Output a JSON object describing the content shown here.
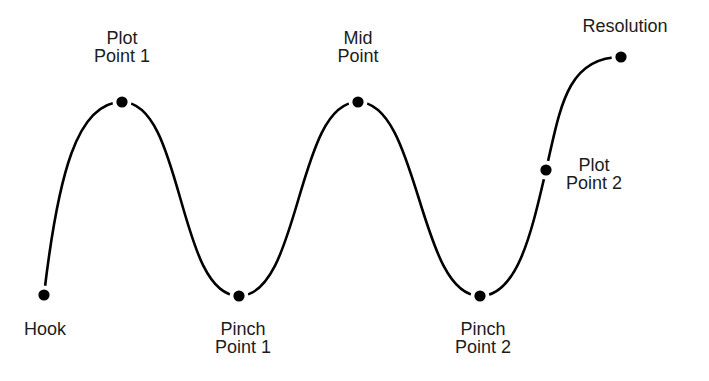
{
  "diagram": {
    "title": "",
    "type": "story-structure-curve",
    "colors": {
      "line": "#000000",
      "dot": "#000000",
      "text": "#1c1c1c",
      "background": "#ffffff"
    },
    "points": [
      {
        "id": "hook",
        "label_lines": [
          "Hook"
        ],
        "level": "low",
        "label_position": "below"
      },
      {
        "id": "plot-point-1",
        "label_lines": [
          "Plot",
          "Point 1"
        ],
        "level": "high",
        "label_position": "above"
      },
      {
        "id": "pinch-point-1",
        "label_lines": [
          "Pinch",
          "Point 1"
        ],
        "level": "low",
        "label_position": "below"
      },
      {
        "id": "mid-point",
        "label_lines": [
          "Mid",
          "Point"
        ],
        "level": "high",
        "label_position": "above"
      },
      {
        "id": "pinch-point-2",
        "label_lines": [
          "Pinch",
          "Point 2"
        ],
        "level": "low",
        "label_position": "below"
      },
      {
        "id": "plot-point-2",
        "label_lines": [
          "Plot",
          "Point 2"
        ],
        "level": "middle",
        "label_position": "right"
      },
      {
        "id": "resolution",
        "label_lines": [
          "Resolution"
        ],
        "level": "top",
        "label_position": "above"
      }
    ]
  }
}
